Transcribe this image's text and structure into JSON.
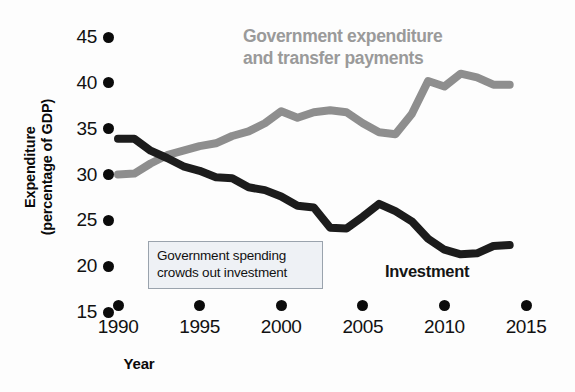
{
  "chart_data": {
    "type": "line",
    "title": "",
    "xlabel": "Year",
    "ylabel": "Expenditure\n(percentage of GDP)",
    "xlim": [
      1990,
      2015
    ],
    "ylim": [
      15,
      45
    ],
    "grid": false,
    "legend_position": "inline-annotations",
    "x_ticks": [
      "1990",
      "1995",
      "2000",
      "2005",
      "2010",
      "2015"
    ],
    "y_ticks": [
      "15",
      "20",
      "25",
      "30",
      "35",
      "40",
      "45"
    ],
    "x": [
      1990,
      1991,
      1992,
      1993,
      1994,
      1995,
      1996,
      1997,
      1998,
      1999,
      2000,
      2001,
      2002,
      2003,
      2004,
      2005,
      2006,
      2007,
      2008,
      2009,
      2010,
      2011,
      2012,
      2013,
      2014
    ],
    "series": [
      {
        "name": "Government expenditure and transfer payments",
        "color": "#8e8e8e",
        "values": [
          30.0,
          30.1,
          31.2,
          32.1,
          32.6,
          33.1,
          33.4,
          34.2,
          34.7,
          35.6,
          36.9,
          36.2,
          36.8,
          37.0,
          36.8,
          35.6,
          34.6,
          34.4,
          36.6,
          40.2,
          39.6,
          41.0,
          40.6,
          39.8,
          39.8
        ]
      },
      {
        "name": "Investment",
        "color": "#1c1c1c",
        "values": [
          33.9,
          33.9,
          32.6,
          31.8,
          30.9,
          30.4,
          29.7,
          29.6,
          28.6,
          28.3,
          27.6,
          26.6,
          26.4,
          24.2,
          24.1,
          25.4,
          26.8,
          26.0,
          24.9,
          23.0,
          21.8,
          21.3,
          21.4,
          22.2,
          22.3
        ]
      }
    ],
    "annotations": [
      {
        "name": "crowding-out-note",
        "text": "Government spending\ncrowds out investment"
      }
    ]
  },
  "labels": {
    "y_axis_title": "Expenditure\n(percentage of GDP)",
    "x_axis_title": "Year",
    "government_series_label": "Government expenditure\nand transfer payments",
    "investment_series_label": "Investment",
    "annotation_text": "Government spending\ncrowds out investment"
  },
  "colors": {
    "government_line": "#8e8e8e",
    "investment_line": "#1c1c1c",
    "annotation_background": "#eef1f5",
    "annotation_border": "#9aa3ad",
    "tick_marker": "#0b0b0b"
  }
}
